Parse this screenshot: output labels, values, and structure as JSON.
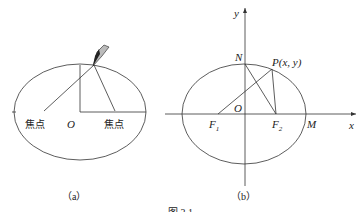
{
  "figure_a": {
    "caption": "（a）",
    "labels": {
      "left_focus": "焦点",
      "origin": "O",
      "right_focus": "焦点"
    }
  },
  "figure_b": {
    "caption": "（b）",
    "labels": {
      "y_axis": "y",
      "x_axis": "x",
      "N": "N",
      "P": "P(x, y)",
      "O": "O",
      "F1": "F",
      "F1_sub": "1",
      "F2": "F",
      "F2_sub": "2",
      "M": "M"
    }
  },
  "figure_caption": "图 3.1",
  "colors": {
    "stroke": "#333333",
    "pencil": "#222222"
  }
}
